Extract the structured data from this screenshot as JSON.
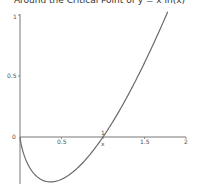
{
  "title": "Around the Critical Point of y = x ln(x)",
  "colors": {
    "curve": "#6a6a6a",
    "axis": "#777777",
    "background": "#ffffff"
  },
  "chart_data": {
    "type": "line",
    "title": "Around the Critical Point of y = x ln(x)",
    "function": "y = x*ln(x)",
    "xlabel": "x",
    "ylabel": "",
    "xlim": [
      0,
      2
    ],
    "ylim": [
      -0.4,
      1
    ],
    "x_ticks": [
      "0.5",
      "1",
      "1.5",
      "2"
    ],
    "y_ticks": [
      "0",
      "0.5",
      "1"
    ],
    "grid": false,
    "legend": null,
    "series": [
      {
        "name": "x ln(x)",
        "x": [
          0.0,
          0.05,
          0.1,
          0.2,
          0.3,
          0.368,
          0.5,
          0.7,
          0.9,
          1.0,
          1.2,
          1.4,
          1.6,
          1.78
        ],
        "y": [
          0.0,
          -0.15,
          -0.23,
          -0.32,
          -0.36,
          -0.368,
          -0.35,
          -0.25,
          -0.09,
          0.0,
          0.22,
          0.47,
          0.75,
          1.03
        ]
      }
    ],
    "annotations": [
      {
        "text": "critical point (min)",
        "x": 0.368,
        "y": -0.368
      }
    ]
  },
  "axis_labels": {
    "x_tick_0_5": "0.5",
    "x_tick_1": "1",
    "x_tick_1_5": "1.5",
    "x_tick_2": "2",
    "x_name": "x",
    "y_tick_0": "0",
    "y_tick_0_5": "0.5",
    "y_tick_1": "1"
  }
}
